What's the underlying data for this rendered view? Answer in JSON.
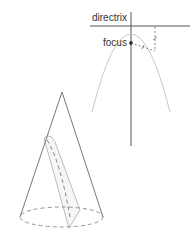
{
  "labels": {
    "directrix": "directrix",
    "focus": "focus"
  },
  "colors": {
    "line": "#555555",
    "parabola": "#c8c8c8",
    "cone": "#777777",
    "dashed": "#888888",
    "plane": "#b5b5b5"
  }
}
